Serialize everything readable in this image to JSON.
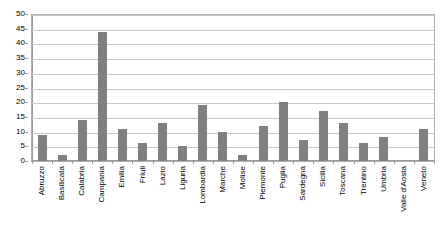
{
  "chart_data": {
    "type": "bar",
    "title": "",
    "subtitle": "",
    "xlabel": "",
    "ylabel": "",
    "ylim": [
      0,
      50
    ],
    "ytick_step": 5,
    "yticks": [
      0,
      5,
      10,
      15,
      20,
      25,
      30,
      35,
      40,
      45,
      50
    ],
    "ytick_labels": [
      "0",
      "5",
      "10",
      "15",
      "20",
      "25",
      "30",
      "35",
      "40",
      "45",
      "50"
    ],
    "grid": true,
    "grid_axis": "y",
    "legend": false,
    "legend_position": "none",
    "bar_color": "#808080",
    "plot_border_color": "#b0b0b0",
    "gridline_color": "#c8c8c8",
    "axis_color": "#9a9a9a",
    "background_color": "#ffffff",
    "categories": [
      "Abruzzo",
      "Basilicata",
      "Calabria",
      "Campania",
      "Emilia",
      "Friuli",
      "Lazio",
      "Liguria",
      "Lombardia",
      "Marche",
      "Molise",
      "Piemonte",
      "Puglia",
      "Sardegna",
      "Sicilia",
      "Toscana",
      "Trentino",
      "Umbria",
      "Valle d'Aosta",
      "Veneto"
    ],
    "values": [
      9,
      2,
      14,
      44,
      11,
      6,
      13,
      5,
      19,
      10,
      2,
      12,
      20,
      7,
      17,
      13,
      6,
      8,
      0,
      11
    ]
  }
}
